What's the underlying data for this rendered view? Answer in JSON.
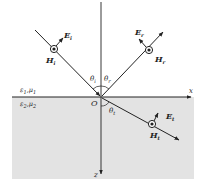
{
  "diagram": {
    "type": "oblique incidence of plane wave at dielectric interface",
    "colors": {
      "line": "#222222",
      "medium2_fill": "#e3e3e3",
      "background": "#ffffff"
    },
    "media": {
      "upper": {
        "eps": "ε",
        "eps_sub": "1",
        "sep": ",",
        "mu": "μ",
        "mu_sub": "1"
      },
      "lower": {
        "eps": "ε",
        "eps_sub": "2",
        "sep": ",",
        "mu": "μ",
        "mu_sub": "2"
      }
    },
    "origin": {
      "label": "O"
    },
    "axes": {
      "x": {
        "label": "x"
      },
      "z": {
        "label": "z"
      }
    },
    "waves": {
      "incident": {
        "E": {
          "main": "E",
          "sub": "i"
        },
        "H": {
          "main": "H",
          "sub": "i"
        },
        "angle": {
          "main": "θ",
          "sub": "i"
        }
      },
      "reflected": {
        "E": {
          "main": "E",
          "sub": "r"
        },
        "H": {
          "main": "H",
          "sub": "r"
        },
        "angle": {
          "main": "θ",
          "sub": "r"
        }
      },
      "transmitted": {
        "E": {
          "main": "E",
          "sub": "t"
        },
        "H": {
          "main": "H",
          "sub": "t"
        },
        "angle": {
          "main": "θ",
          "sub": "t"
        }
      }
    }
  }
}
